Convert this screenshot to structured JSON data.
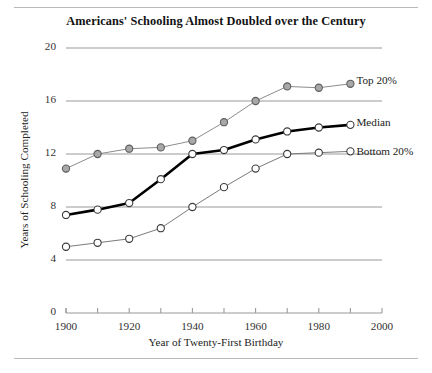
{
  "chart_data": {
    "type": "line",
    "title": "Americans' Schooling Almost Doubled over the Century",
    "xlabel": "Year of Twenty-First Birthday",
    "ylabel": "Years of Schooling Completed",
    "xlim": [
      1900,
      2000
    ],
    "ylim": [
      0,
      20
    ],
    "yticks": [
      0,
      4,
      8,
      12,
      16,
      20
    ],
    "ytick_labels": [
      "0",
      "4",
      "8",
      "12",
      "16",
      "20"
    ],
    "xticks": [
      1900,
      1920,
      1940,
      1960,
      1980,
      2000
    ],
    "xtick_labels": [
      "1900",
      "1920",
      "1940",
      "1960",
      "1980",
      "2000"
    ],
    "x_minor_ticks": [
      1910,
      1930,
      1950,
      1970,
      1990
    ],
    "grid": "horizontal",
    "legend_position": "right-inline",
    "x": [
      1900,
      1910,
      1920,
      1930,
      1940,
      1950,
      1960,
      1970,
      1980,
      1990
    ],
    "series": [
      {
        "name": "Top 20%",
        "marker": "filled-circle",
        "color": "#8c8c8c",
        "line_width": "thin",
        "values": [
          10.9,
          12.0,
          12.4,
          12.5,
          13.0,
          14.4,
          16.0,
          17.1,
          17.0,
          17.3
        ]
      },
      {
        "name": "Median",
        "marker": "open-circle",
        "color": "#000000",
        "line_width": "bold",
        "values": [
          7.4,
          7.8,
          8.3,
          10.1,
          12.0,
          12.3,
          13.1,
          13.7,
          14.0,
          14.2
        ]
      },
      {
        "name": "Bottom 20%",
        "marker": "open-circle",
        "color": "#7a7a7a",
        "line_width": "thin",
        "values": [
          5.0,
          5.3,
          5.6,
          6.4,
          8.0,
          9.5,
          10.9,
          12.0,
          12.1,
          12.2
        ]
      }
    ]
  },
  "legend": {
    "top": "Top 20%",
    "median": "Median",
    "bottom": "Bottom 20%"
  }
}
